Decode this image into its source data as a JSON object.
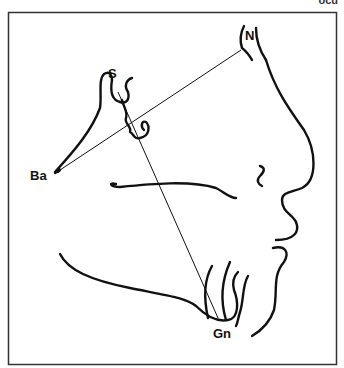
{
  "figure": {
    "type": "cephalometric tracing",
    "corner_text": "ocu",
    "landmarks": [
      {
        "id": "S",
        "label": "S"
      },
      {
        "id": "N",
        "label": "N"
      },
      {
        "id": "Ba",
        "label": "Ba"
      },
      {
        "id": "Gn",
        "label": "Gn"
      }
    ],
    "lines": [
      {
        "from": "Ba",
        "to": "N"
      },
      {
        "from": "S",
        "to": "Gn"
      }
    ],
    "colors": {
      "stroke": "#111111",
      "background": "#ffffff",
      "frame": "#333333"
    }
  }
}
